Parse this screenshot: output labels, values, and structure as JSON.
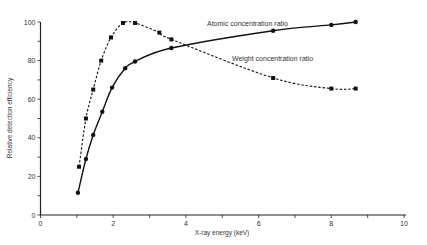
{
  "chart_data": {
    "type": "line",
    "title": "",
    "xlabel": "X-ray energy (keV)",
    "ylabel": "Relative detection efficiency",
    "xlim": [
      0,
      10
    ],
    "ylim": [
      0,
      100
    ],
    "x_ticks": [
      0,
      1,
      2,
      3,
      4,
      5,
      6,
      7,
      8,
      9,
      10
    ],
    "x_tick_labels": [
      "0",
      "",
      "2",
      "",
      "4",
      "",
      "6",
      "",
      "8",
      "",
      "10"
    ],
    "y_ticks": [
      0,
      10,
      20,
      30,
      40,
      50,
      60,
      70,
      80,
      90,
      100
    ],
    "y_tick_labels": [
      "0",
      "",
      "20",
      "",
      "40",
      "",
      "60",
      "",
      "80",
      "",
      "100"
    ],
    "grid": false,
    "legend": "inline labels",
    "series": [
      {
        "name": "Atomic concentration ratio",
        "style": "solid",
        "x": [
          1.03,
          1.25,
          1.45,
          1.7,
          1.97,
          2.33,
          2.6,
          3.6,
          6.4,
          8.0,
          8.67
        ],
        "values": [
          11.5,
          29,
          41.5,
          53.5,
          66,
          76,
          79.5,
          86.5,
          95.5,
          98.5,
          100
        ]
      },
      {
        "name": "Weight concentration ratio",
        "style": "dashed",
        "x": [
          1.06,
          1.25,
          1.45,
          1.67,
          1.94,
          2.27,
          2.6,
          3.27,
          3.6,
          6.4,
          8.0,
          8.67
        ],
        "values": [
          25,
          50,
          65,
          80,
          92,
          99.5,
          99.5,
          94.5,
          91,
          71,
          65.5,
          65.5
        ]
      }
    ],
    "annotations": [
      {
        "text": "Atomic concentration ratio",
        "x": 5.2,
        "y": 98
      },
      {
        "text": "Weight concentration ratio",
        "x": 5.5,
        "y": 84
      }
    ]
  },
  "colors": {
    "line": "#111111",
    "axis": "#222222",
    "text": "#333333"
  }
}
